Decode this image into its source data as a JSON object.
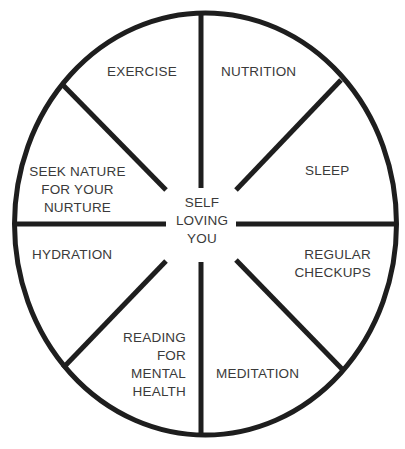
{
  "diagram": {
    "type": "wheel",
    "center_label": "SELF\nLOVING\nYOU",
    "segments": [
      {
        "label": "EXERCISE"
      },
      {
        "label": "NUTRITION"
      },
      {
        "label": "SLEEP"
      },
      {
        "label": "REGULAR\nCHECKUPS"
      },
      {
        "label": "MEDITATION"
      },
      {
        "label": "READING\nFOR\nMENTAL\nHEALTH"
      },
      {
        "label": "HYDRATION"
      },
      {
        "label": "SEEK NATURE\nFOR YOUR\nNURTURE"
      }
    ],
    "colors": {
      "stroke": "#1e1e1e",
      "text": "#3a3a3a",
      "background": "#ffffff"
    }
  }
}
